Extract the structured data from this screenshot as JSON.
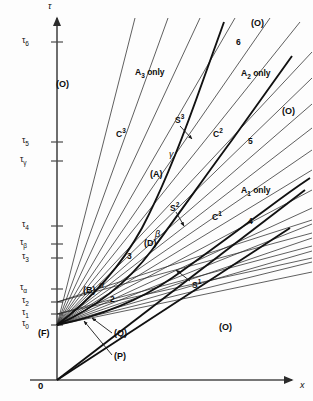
{
  "figure": {
    "type": "line-diagram",
    "background": "#fdfdfd",
    "ink_color": "#111111"
  },
  "axes": {
    "y_label": "τ",
    "x_label": "x",
    "origin_label": "0",
    "y_ticks": [
      {
        "label_base": "τ",
        "label_sub": "6",
        "y": 42
      },
      {
        "label_base": "τ",
        "label_sub": "5",
        "y": 142
      },
      {
        "label_base": "τ",
        "label_sub": "γ",
        "y": 161
      },
      {
        "label_base": "τ",
        "label_sub": "4",
        "y": 226
      },
      {
        "label_base": "τ",
        "label_sub": "β",
        "y": 244
      },
      {
        "label_base": "τ",
        "label_sub": "3",
        "y": 258
      },
      {
        "label_base": "τ",
        "label_sub": "α",
        "y": 289
      },
      {
        "label_base": "τ",
        "label_sub": "2",
        "y": 302
      },
      {
        "label_base": "τ",
        "label_sub": "1",
        "y": 314
      },
      {
        "label_base": "τ",
        "label_sub": "0",
        "y": 325
      }
    ]
  },
  "region_labels": [
    {
      "text": "(O)",
      "x": 56,
      "y": 80
    },
    {
      "text": "(O)",
      "x": 251,
      "y": 19
    },
    {
      "text": "(O)",
      "x": 282,
      "y": 107
    },
    {
      "text": "(O)",
      "x": 219,
      "y": 323
    },
    {
      "text": "(F)",
      "x": 38,
      "y": 329
    },
    {
      "text": "(A)",
      "x": 150,
      "y": 170
    },
    {
      "text": "(B)",
      "x": 83,
      "y": 286
    },
    {
      "text": "(D)",
      "x": 144,
      "y": 239
    },
    {
      "text": "(Q)",
      "x": 114,
      "y": 329
    },
    {
      "text": "(P)",
      "x": 114,
      "y": 352
    }
  ],
  "curve_labels": [
    {
      "base": "A",
      "sub": "3",
      "suffix": " only",
      "x": 135,
      "y": 68
    },
    {
      "base": "A",
      "sub": "2",
      "suffix": " only",
      "x": 241,
      "y": 69
    },
    {
      "base": "A",
      "sub": "1",
      "suffix": " only",
      "x": 241,
      "y": 186
    },
    {
      "base": "C",
      "sup": "3",
      "x": 116,
      "y": 128
    },
    {
      "base": "C",
      "sup": "2",
      "x": 213,
      "y": 128
    },
    {
      "base": "C",
      "sup": "1",
      "x": 212,
      "y": 211
    },
    {
      "base": "S",
      "sup": "3",
      "x": 175,
      "y": 120
    },
    {
      "base": "S",
      "sup": "2",
      "x": 170,
      "y": 208
    },
    {
      "base": "S",
      "sup": "1",
      "x": 192,
      "y": 279
    }
  ],
  "point_numbers": [
    {
      "text": "6",
      "x": 236,
      "y": 38
    },
    {
      "text": "5",
      "x": 248,
      "y": 137
    },
    {
      "text": "4",
      "x": 248,
      "y": 217
    },
    {
      "text": "3",
      "x": 127,
      "y": 252
    },
    {
      "text": "2",
      "x": 110,
      "y": 295
    }
  ],
  "greek_marks": [
    {
      "text": "γ",
      "x": 169,
      "y": 150
    },
    {
      "text": "β",
      "x": 155,
      "y": 230
    },
    {
      "text": "α",
      "x": 99,
      "y": 281
    }
  ]
}
